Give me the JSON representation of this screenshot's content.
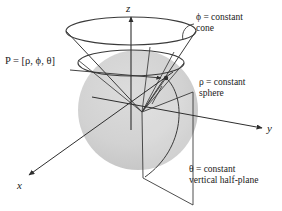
{
  "figure": {
    "kind": "spherical-coordinates-diagram",
    "background_color": "#ffffff",
    "stroke_color": "#3a3a3a",
    "sphere_fill_color": "#d2d2d2",
    "text_color": "#1a1a1a"
  },
  "axes": {
    "z": {
      "label": "z",
      "x": 129,
      "y": 9
    },
    "y": {
      "label": "y",
      "x": 269,
      "y": 130
    },
    "x": {
      "label": "x",
      "x": 19,
      "y": 187
    }
  },
  "point": {
    "label": "P = [ρ, ϕ, θ]",
    "x": 6,
    "y": 60
  },
  "callouts": [
    {
      "name": "cone-callout",
      "line1": "ϕ = constant",
      "line2": "cone",
      "x": 196,
      "y": 16
    },
    {
      "name": "sphere-callout",
      "line1": "ρ = constant",
      "line2": "sphere",
      "x": 198,
      "y": 81
    },
    {
      "name": "half-plane-callout",
      "line1": "θ = constant",
      "line2": "vertical half-plane",
      "x": 190,
      "y": 168
    }
  ],
  "geometry": {
    "origin": {
      "x": 142,
      "y": 112
    },
    "sphere": {
      "cx": 138,
      "cy": 110,
      "r": 60
    },
    "cone_rim": {
      "cx": 131,
      "cy": 31,
      "rx": 65,
      "ry": 14
    },
    "inner_circle": {
      "cx": 131,
      "cy": 63,
      "rx": 53,
      "ry": 12
    },
    "point_P": {
      "x": 166,
      "y": 78
    }
  }
}
